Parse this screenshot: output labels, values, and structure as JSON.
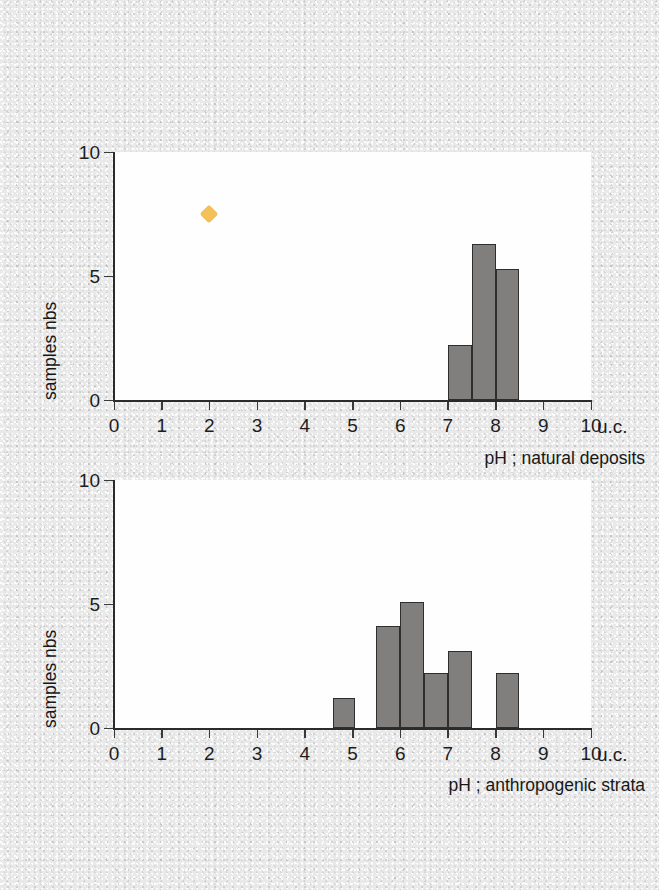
{
  "figure": {
    "background_color": "#e8e8e8",
    "plot_background_color": "#fefefe",
    "bar_fill_color": "#807f7d",
    "bar_edge_color": "#2e2e2e",
    "marker_color": "#f4c05a",
    "axis_color": "#2b2b2b"
  },
  "chart_data": [
    {
      "type": "bar",
      "id": "natural-deposits",
      "title": "",
      "xlabel": "pH ; natural deposits",
      "ylabel": "samples nbs",
      "unit_label": "u.c.",
      "xlim": [
        0,
        10
      ],
      "ylim": [
        0,
        10
      ],
      "xticks": [
        0,
        1,
        2,
        3,
        4,
        5,
        6,
        7,
        8,
        9,
        10
      ],
      "xtick_labels": [
        "0",
        "1",
        "2",
        "3",
        "4",
        "5",
        "6",
        "7",
        "8",
        "9",
        "10"
      ],
      "yticks": [
        0,
        5,
        10
      ],
      "ytick_labels": [
        "0",
        "5",
        "10"
      ],
      "grid": false,
      "legend": "none",
      "bin_width": 0.5,
      "bins": [
        {
          "x0": 7.0,
          "x1": 7.5,
          "value": 2.2
        },
        {
          "x0": 7.5,
          "x1": 8.0,
          "value": 6.3
        },
        {
          "x0": 8.0,
          "x1": 8.5,
          "value": 5.3
        }
      ],
      "points": [
        {
          "x": 2.0,
          "y": 7.5,
          "marker": "diamond",
          "color": "#f4c05a"
        }
      ]
    },
    {
      "type": "bar",
      "id": "anthropogenic-strata",
      "title": "",
      "xlabel": "pH ; anthropogenic strata",
      "ylabel": "samples nbs",
      "unit_label": "u.c.",
      "xlim": [
        0,
        10
      ],
      "ylim": [
        0,
        10
      ],
      "xticks": [
        0,
        1,
        2,
        3,
        4,
        5,
        6,
        7,
        8,
        9,
        10
      ],
      "xtick_labels": [
        "0",
        "1",
        "2",
        "3",
        "4",
        "5",
        "6",
        "7",
        "8",
        "9",
        "10"
      ],
      "yticks": [
        0,
        5,
        10
      ],
      "ytick_labels": [
        "0",
        "5",
        "10"
      ],
      "grid": false,
      "legend": "none",
      "bin_width": 0.5,
      "bins": [
        {
          "x0": 4.6,
          "x1": 5.05,
          "value": 1.2
        },
        {
          "x0": 5.5,
          "x1": 6.0,
          "value": 4.1
        },
        {
          "x0": 6.0,
          "x1": 6.5,
          "value": 5.1
        },
        {
          "x0": 6.5,
          "x1": 7.0,
          "value": 2.2
        },
        {
          "x0": 7.0,
          "x1": 7.5,
          "value": 3.1
        },
        {
          "x0": 8.0,
          "x1": 8.5,
          "value": 2.2
        }
      ],
      "points": []
    }
  ]
}
